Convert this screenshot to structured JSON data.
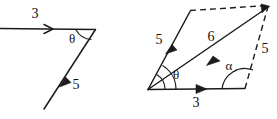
{
  "diagram": {
    "background_color": "#ffffff",
    "stroke_color": "#1b1b1b",
    "left_figure": {
      "name": "angle-between-vectors",
      "labels": {
        "horizontal_vector": "3",
        "diagonal_vector": "5",
        "angle": "θ"
      },
      "elements": [
        {
          "id": "horizontal-arrow",
          "label": "3",
          "type": "vector-arrow",
          "direction": "right"
        },
        {
          "id": "diagonal-arrow",
          "label": "5",
          "type": "vector-arrow",
          "direction": "up-right"
        },
        {
          "id": "theta-arc",
          "label": "θ",
          "type": "angle-arc",
          "arcs": 1
        }
      ]
    },
    "right_figure": {
      "name": "parallelogram-law-of-vector-addition",
      "labels": {
        "base_vector": "3",
        "side_vector": "5",
        "resultant_vector": "6",
        "opposite_side_vector": "5",
        "angle_theta": "θ",
        "angle_alpha": "α"
      },
      "elements": [
        {
          "id": "base-arrow",
          "label": "3",
          "type": "vector-arrow",
          "direction": "right",
          "style": "solid"
        },
        {
          "id": "left-side-arrow",
          "label": "5",
          "type": "vector-arrow",
          "direction": "up-right",
          "style": "solid"
        },
        {
          "id": "resultant-arrow",
          "label": "6",
          "type": "vector-arrow",
          "direction": "up-right",
          "style": "solid"
        },
        {
          "id": "top-edge",
          "label": "",
          "type": "construction-line",
          "style": "dashed"
        },
        {
          "id": "right-side",
          "label": "5",
          "type": "construction-line",
          "style": "dashed"
        },
        {
          "id": "theta-arc",
          "label": "θ",
          "type": "angle-arc",
          "arcs": 2
        },
        {
          "id": "alpha-arc",
          "label": "α",
          "type": "angle-arc",
          "arcs": 1
        }
      ]
    }
  }
}
